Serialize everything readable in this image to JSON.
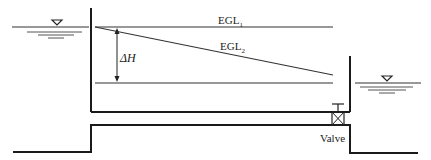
{
  "diagram": {
    "labels": {
      "egl1": "EGL",
      "egl1_sub": "1",
      "egl2": "EGL",
      "egl2_sub": "2",
      "delta_h": "ΔH",
      "valve": "Valve"
    },
    "colors": {
      "line": "#1a1a1a",
      "egl": "#333333",
      "water": "#555555"
    }
  }
}
